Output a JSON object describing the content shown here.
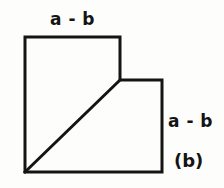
{
  "figure": {
    "caption": "(b)",
    "background_color": "#fdfdfb",
    "stroke_color": "#141414",
    "stroke_width": 3,
    "labels": {
      "top": "a - b",
      "right": "a - b"
    },
    "outline_points": "25,37 120,37 120,80 162,80 162,172 25,172",
    "diagonal": {
      "x1": 25,
      "y1": 172,
      "x2": 120,
      "y2": 80
    }
  },
  "chart_data": {
    "type": "diagram",
    "title": "(b)",
    "shape": "notched-square-with-diagonal",
    "vertices": [
      [
        25,
        37
      ],
      [
        120,
        37
      ],
      [
        120,
        80
      ],
      [
        162,
        80
      ],
      [
        162,
        172
      ],
      [
        25,
        172
      ]
    ],
    "segments": [
      {
        "name": "top-edge",
        "from": [
          25,
          37
        ],
        "to": [
          120,
          37
        ],
        "label": "a - b"
      },
      {
        "name": "upper-right-edge",
        "from": [
          120,
          37
        ],
        "to": [
          120,
          80
        ],
        "label": ""
      },
      {
        "name": "step-edge",
        "from": [
          120,
          80
        ],
        "to": [
          162,
          80
        ],
        "label": ""
      },
      {
        "name": "right-edge",
        "from": [
          162,
          80
        ],
        "to": [
          162,
          172
        ],
        "label": "a - b"
      },
      {
        "name": "bottom-edge",
        "from": [
          162,
          172
        ],
        "to": [
          25,
          172
        ],
        "label": ""
      },
      {
        "name": "left-edge",
        "from": [
          25,
          172
        ],
        "to": [
          25,
          37
        ],
        "label": ""
      },
      {
        "name": "diagonal",
        "from": [
          25,
          172
        ],
        "to": [
          120,
          80
        ],
        "label": ""
      }
    ],
    "annotations": [
      "a - b",
      "a - b",
      "(b)"
    ]
  }
}
